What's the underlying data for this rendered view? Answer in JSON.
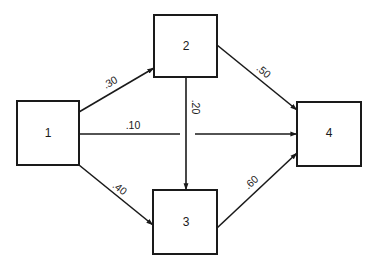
{
  "diagram": {
    "type": "directed-graph",
    "colors": {
      "stroke": "#1a1a1a",
      "background": "#ffffff"
    },
    "nodes": [
      {
        "id": "1",
        "label": "1"
      },
      {
        "id": "2",
        "label": "2"
      },
      {
        "id": "3",
        "label": "3"
      },
      {
        "id": "4",
        "label": "4"
      }
    ],
    "edges": [
      {
        "from": "1",
        "to": "2",
        "label": ".30"
      },
      {
        "from": "1",
        "to": "4",
        "label": ".10"
      },
      {
        "from": "1",
        "to": "3",
        "label": ".40"
      },
      {
        "from": "2",
        "to": "4",
        "label": ".50"
      },
      {
        "from": "2",
        "to": "3",
        "label": ".20"
      },
      {
        "from": "3",
        "to": "4",
        "label": ".60"
      }
    ]
  }
}
